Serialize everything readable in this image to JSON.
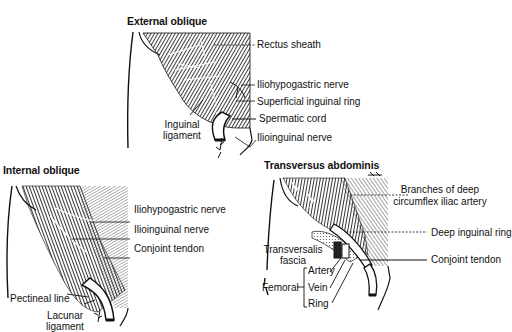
{
  "figure": {
    "panels": [
      {
        "id": "external-oblique",
        "title": "External oblique",
        "labels": {
          "rectus_sheath": "Rectus sheath",
          "iliohypogastric_nerve": "Iliohypogastric nerve",
          "superficial_inguinal_ring": "Superficial inguinal ring",
          "spermatic_cord": "Spermatic cord",
          "ilioinguinal_nerve": "Ilioinguinal nerve",
          "inguinal_ligament_1": "Inguinal",
          "inguinal_ligament_2": "ligament"
        }
      },
      {
        "id": "internal-oblique",
        "title": "Internal oblique",
        "labels": {
          "iliohypogastric_nerve": "Iliohypogastric nerve",
          "ilioinguinal_nerve": "Ilioinguinal nerve",
          "conjoint_tendon": "Conjoint tendon",
          "pectineal_line": "Pectineal line",
          "lacunar_ligament_1": "Lacunar",
          "lacunar_ligament_2": "ligament"
        }
      },
      {
        "id": "transversus-abdominis",
        "title": "Transversus abdominis",
        "labels": {
          "branches_1": "Branches of deep",
          "branches_2": "circumflex iliac artery",
          "deep_inguinal_ring": "Deep inguinal ring",
          "conjoint_tendon": "Conjoint tendon",
          "transversalis_fascia_1": "Transversalis",
          "transversalis_fascia_2": "fascia",
          "femoral": "Femoral",
          "artery": "Artery",
          "vein": "Vein",
          "ring": "Ring"
        }
      }
    ]
  }
}
